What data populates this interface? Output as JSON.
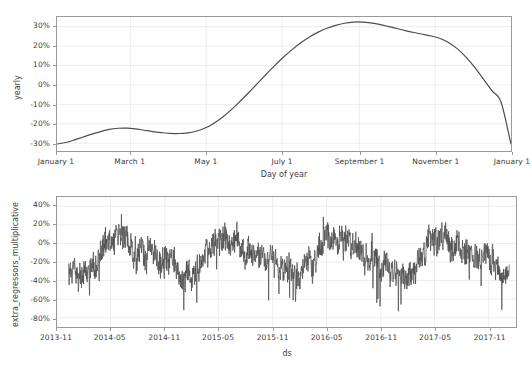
{
  "figure": {
    "background_color": "#ffffff",
    "line_color": "#4d4d4d",
    "grid_color": "#e8e8e8",
    "axis_color": "#9a9a9a",
    "text_color": "#3c3c3c"
  },
  "chart_data": [
    {
      "type": "line",
      "title": "",
      "xlabel": "Day of year",
      "ylabel": "yearly",
      "grid": true,
      "legend": "none",
      "xtick_labels": [
        "January 1",
        "March 1",
        "May 1",
        "July 1",
        "September 1",
        "November 1",
        "January 1"
      ],
      "xtick_positions": [
        1,
        60,
        121,
        182,
        244,
        305,
        366
      ],
      "ytick_labels": [
        "30%",
        "20%",
        "10%",
        "0%",
        "-10%",
        "-20%",
        "-30%"
      ],
      "ytick_values": [
        30,
        20,
        10,
        0,
        -10,
        -20,
        -30
      ],
      "xlim": [
        1,
        366
      ],
      "ylim": [
        -34,
        35
      ],
      "x": [
        1,
        8,
        15,
        22,
        29,
        36,
        43,
        50,
        57,
        64,
        71,
        78,
        85,
        92,
        99,
        106,
        113,
        120,
        127,
        134,
        141,
        148,
        155,
        162,
        169,
        176,
        183,
        190,
        197,
        204,
        211,
        218,
        225,
        232,
        239,
        246,
        253,
        260,
        267,
        274,
        281,
        288,
        295,
        302,
        309,
        316,
        323,
        330,
        337,
        344,
        351,
        358,
        366
      ],
      "values": [
        -30.4,
        -29.6,
        -28.3,
        -26.8,
        -25.3,
        -24.0,
        -22.9,
        -22.3,
        -22.2,
        -22.6,
        -23.3,
        -24.0,
        -24.5,
        -24.9,
        -25.0,
        -24.7,
        -23.8,
        -22.2,
        -19.8,
        -16.6,
        -12.8,
        -8.5,
        -4.0,
        0.7,
        5.4,
        10.0,
        14.3,
        18.2,
        21.7,
        24.7,
        27.2,
        29.2,
        30.7,
        31.8,
        32.4,
        32.4,
        32.0,
        31.2,
        30.2,
        29.1,
        28.0,
        27.0,
        26.1,
        25.2,
        23.9,
        21.8,
        18.6,
        14.2,
        8.9,
        2.9,
        -3.2,
        -8.9,
        -30.4
      ]
    },
    {
      "type": "line",
      "title": "",
      "xlabel": "ds",
      "ylabel": "extra_regressors_multiplicative",
      "grid": true,
      "legend": "none",
      "xtick_labels": [
        "2013-11",
        "2014-05",
        "2014-11",
        "2015-05",
        "2015-11",
        "2016-05",
        "2016-11",
        "2017-05",
        "2017-11"
      ],
      "ytick_labels": [
        "40%",
        "20%",
        "0%",
        "-20%",
        "-40%",
        "-60%",
        "-80%"
      ],
      "ytick_values": [
        40,
        20,
        0,
        -20,
        -40,
        -60,
        -80
      ],
      "xlim": [
        "2013-11-01",
        "2018-02-01"
      ],
      "ylim": [
        -90,
        50
      ],
      "series_description": "Noisy daily multiplicative extra-regressor component with strong annual seasonality; peaks near mid-year around +30% to +45% and troughs near year boundaries around -40% to -85%.",
      "seasonal_peaks": [
        {
          "period": "2014 mid-year",
          "approx_peak": 43
        },
        {
          "period": "2015 mid-year",
          "approx_peak": 45
        },
        {
          "period": "2016 mid-year",
          "approx_peak": 41
        },
        {
          "period": "2017 mid-year",
          "approx_peak": 42
        }
      ],
      "seasonal_troughs": [
        {
          "period": "2013-12 / 2014-01",
          "approx_trough": -85
        },
        {
          "period": "2014-12 / 2015-01",
          "approx_trough": -75
        },
        {
          "period": "2015-12 / 2016-01",
          "approx_trough": -67
        },
        {
          "period": "2016-12 / 2017-01",
          "approx_trough": -62
        },
        {
          "period": "2017-12 / 2018-01",
          "approx_trough": -73
        }
      ]
    }
  ]
}
